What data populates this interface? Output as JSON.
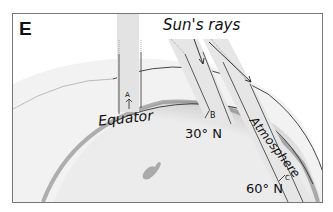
{
  "panel": {
    "letter": "E"
  },
  "labels": {
    "sun_rays": "Sun's rays",
    "atmosphere": "Atmosphere",
    "equator": "Equator",
    "lat_30": "30° N",
    "lat_60": "60° N",
    "point_a": "A",
    "point_b": "B",
    "point_c": "C"
  },
  "colors": {
    "earth": "#e6e6e6",
    "atmosphere": "#efefef",
    "ray_band": "#e2e2e2",
    "line": "#333333"
  }
}
